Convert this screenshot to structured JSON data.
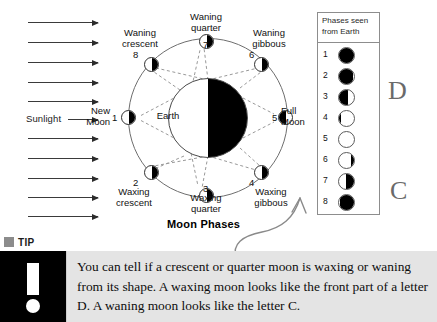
{
  "figure": {
    "title": "Moon Phases",
    "center_body_label": "Earth",
    "sunlight_label": "Sunlight",
    "ray_count": 11,
    "sun_direction": "left-to-right"
  },
  "phases_around_orbit": [
    {
      "number": "1",
      "name_line1": "New",
      "name_line2": "Moon",
      "position": "left",
      "lit_side": "left",
      "dark_side": "right"
    },
    {
      "number": "2",
      "name_line1": "Waxing",
      "name_line2": "crescent",
      "position": "lower-left",
      "lit_side": "left",
      "dark_side": "right"
    },
    {
      "number": "3",
      "name_line1": "Waxing",
      "name_line2": "quarter",
      "position": "bottom",
      "lit_side": "left",
      "dark_side": "right"
    },
    {
      "number": "4",
      "name_line1": "Waxing",
      "name_line2": "gibbous",
      "position": "lower-right",
      "lit_side": "left",
      "dark_side": "right"
    },
    {
      "number": "5",
      "name_line1": "Full",
      "name_line2": "Moon",
      "position": "right",
      "lit_side": "right",
      "dark_side": "left"
    },
    {
      "number": "6",
      "name_line1": "Waning",
      "name_line2": "gibbous",
      "position": "upper-right",
      "lit_side": "left",
      "dark_side": "right"
    },
    {
      "number": "7",
      "name_line1": "Waning",
      "name_line2": "quarter",
      "position": "top",
      "lit_side": "left",
      "dark_side": "right"
    },
    {
      "number": "8",
      "name_line1": "Waning",
      "name_line2": "crescent",
      "position": "upper-left",
      "lit_side": "left",
      "dark_side": "right"
    }
  ],
  "phases_table": {
    "header_line1": "Phases seen",
    "header_line2": "from Earth",
    "rows": [
      {
        "index": "1",
        "appearance": "new-moon-fully-dark",
        "dark_fraction": 1.0,
        "dark_from": "full"
      },
      {
        "index": "2",
        "appearance": "waxing-crescent-mostly-dark",
        "dark_fraction": 0.82,
        "dark_from": "left"
      },
      {
        "index": "3",
        "appearance": "first-quarter-half-lit",
        "dark_fraction": 0.5,
        "dark_from": "left"
      },
      {
        "index": "4",
        "appearance": "waxing-gibbous-mostly-lit",
        "dark_fraction": 0.14,
        "dark_from": "left"
      },
      {
        "index": "5",
        "appearance": "full-moon-fully-lit",
        "dark_fraction": 0.0,
        "dark_from": "none"
      },
      {
        "index": "6",
        "appearance": "waning-gibbous-mostly-lit",
        "dark_fraction": 0.18,
        "dark_from": "right"
      },
      {
        "index": "7",
        "appearance": "last-quarter-half-lit",
        "dark_fraction": 0.5,
        "dark_from": "right"
      },
      {
        "index": "8",
        "appearance": "waning-crescent-mostly-dark",
        "dark_fraction": 0.8,
        "dark_from": "right"
      }
    ]
  },
  "annotations": {
    "letter_d": "D",
    "letter_c": "C"
  },
  "tip": {
    "label": "TIP",
    "icon": "exclamation-mark",
    "text": "You can tell if a crescent or quarter moon is waxing or waning from its shape. A waxing moon looks like the front part of a letter D. A waning moon looks like the letter C."
  }
}
